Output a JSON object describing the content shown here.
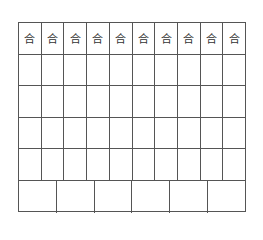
{
  "grid": {
    "header_row": [
      "合",
      "合",
      "合",
      "合",
      "合",
      "合",
      "合",
      "合",
      "合",
      "合"
    ],
    "columns": 10,
    "empty_rows": 4,
    "bottom_row_cells": 6,
    "line_color": "#555555"
  }
}
